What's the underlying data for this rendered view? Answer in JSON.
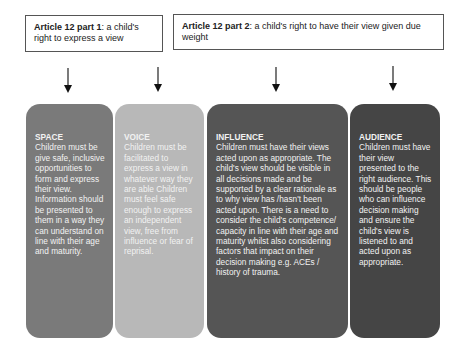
{
  "headers": [
    {
      "bold": "Article 12 part 1",
      "text": ": a child's right to express a view"
    },
    {
      "bold": "Article 12 part 2",
      "text": ":  a child's right to have their view given due weight"
    }
  ],
  "arrows": [
    {
      "icon": "arrow-down-icon",
      "x": 68
    },
    {
      "icon": "arrow-down-icon",
      "x": 158
    },
    {
      "icon": "arrow-down-icon",
      "x": 276
    },
    {
      "icon": "arrow-down-icon",
      "x": 393
    }
  ],
  "columns": [
    {
      "title": "SPACE",
      "body": "Children must be give safe, inclusive opportunities to form and express their view. Information should be presented to them in a way they can understand on line with their age and maturity.",
      "color": "#7a7a7a"
    },
    {
      "title": "VOICE",
      "body": "Children must be facilitated to express a view in whatever way they are able Children must feel safe enough to express an independent view, free from influence or fear of reprisal.",
      "color": "#b8b8b8"
    },
    {
      "title": "INFLUENCE",
      "body": "Children must have their views acted upon as appropriate. The child's view should be visible in all decisions made and be supported by a clear rationale as to why view has /hasn't been acted upon. There is a need to consider the child's competence/ capacity in line with their age and maturity whilst also considering factors that impact on their decision making e.g. ACEs / history of trauma.",
      "color": "#555555"
    },
    {
      "title": "AUDIENCE",
      "body": "Children must have their view presented to the right audience. This should be people who can influence decision making and ensure the child's view is listened to and acted upon as appropriate.",
      "color": "#454545"
    }
  ]
}
